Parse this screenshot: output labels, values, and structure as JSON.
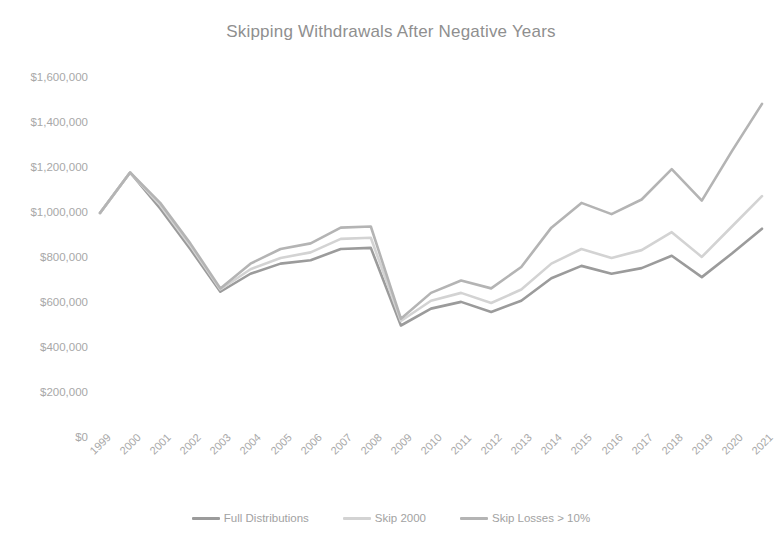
{
  "chart_data": {
    "type": "line",
    "title": "Skipping Withdrawals After Negative Years",
    "xlabel": "",
    "ylabel": "",
    "grid": false,
    "legend_position": "bottom",
    "ylim": [
      0,
      1600000
    ],
    "ytick_step": 200000,
    "ytick_labels": [
      "$1,600,000",
      "$1,400,000",
      "$1,200,000",
      "$1,000,000",
      "$800,000",
      "$600,000",
      "$400,000",
      "$200,000",
      "$0"
    ],
    "ytick_values": [
      1600000,
      1400000,
      1200000,
      1000000,
      800000,
      600000,
      400000,
      200000,
      0
    ],
    "categories": [
      "1999",
      "2000",
      "2001",
      "2002",
      "2003",
      "2004",
      "2005",
      "2006",
      "2007",
      "2008",
      "2009",
      "2010",
      "2011",
      "2012",
      "2013",
      "2014",
      "2015",
      "2016",
      "2017",
      "2018",
      "2019",
      "2020",
      "2021"
    ],
    "series": [
      {
        "name": "Full Distributions",
        "color": "#9b9b9b",
        "values": [
          1000000,
          1180000,
          1020000,
          840000,
          650000,
          730000,
          775000,
          790000,
          840000,
          845000,
          500000,
          575000,
          605000,
          560000,
          610000,
          710000,
          765000,
          730000,
          755000,
          810000,
          715000,
          820000,
          930000
        ]
      },
      {
        "name": "Skip 2000",
        "color": "#d3d3d3",
        "values": [
          1000000,
          1180000,
          1035000,
          855000,
          660000,
          750000,
          800000,
          825000,
          885000,
          890000,
          520000,
          610000,
          645000,
          600000,
          660000,
          775000,
          840000,
          800000,
          835000,
          915000,
          805000,
          940000,
          1075000
        ]
      },
      {
        "name": "Skip Losses > 10%",
        "color": "#b4b4b4",
        "values": [
          1000000,
          1180000,
          1045000,
          865000,
          665000,
          775000,
          840000,
          865000,
          935000,
          940000,
          530000,
          645000,
          700000,
          665000,
          760000,
          935000,
          1045000,
          995000,
          1060000,
          1195000,
          1055000,
          1275000,
          1485000
        ]
      }
    ]
  },
  "legend": {
    "items": [
      {
        "label": "Full Distributions",
        "color": "#9b9b9b"
      },
      {
        "label": "Skip 2000",
        "color": "#d3d3d3"
      },
      {
        "label": "Skip Losses > 10%",
        "color": "#b4b4b4"
      }
    ]
  }
}
